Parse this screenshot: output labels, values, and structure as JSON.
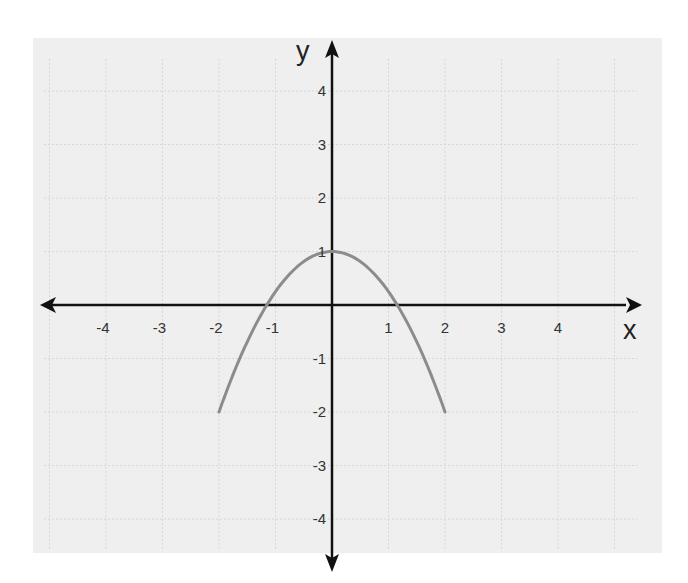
{
  "chart_data": {
    "type": "line",
    "title": "",
    "xlabel": "x",
    "ylabel": "y",
    "xlim": [
      -5,
      5
    ],
    "ylim": [
      -4,
      4
    ],
    "grid": true,
    "x_ticks": [
      "-4",
      "-3",
      "-2",
      "-1",
      "1",
      "2",
      "3",
      "4"
    ],
    "y_ticks": [
      "4",
      "3",
      "2",
      "1",
      "-1",
      "-2",
      "-3",
      "-4"
    ],
    "series": [
      {
        "name": "parabola",
        "equation": "y = 1 - 0.75x^2",
        "domain": [
          -2,
          2
        ],
        "x": [
          -2,
          -1.5,
          -1,
          -0.5,
          0,
          0.5,
          1,
          1.5,
          2
        ],
        "values": [
          -2,
          -0.69,
          0.25,
          0.81,
          1,
          0.81,
          0.25,
          -0.69,
          -2
        ]
      }
    ]
  },
  "colors": {
    "background": "#efefef",
    "grid": "#d6d6d6",
    "axis": "#111111",
    "curve": "#8c8c8c"
  },
  "geometry": {
    "origin_x": 332,
    "origin_y": 305,
    "px_per_unit_x": 56.5,
    "px_per_unit_y": 53.5
  }
}
